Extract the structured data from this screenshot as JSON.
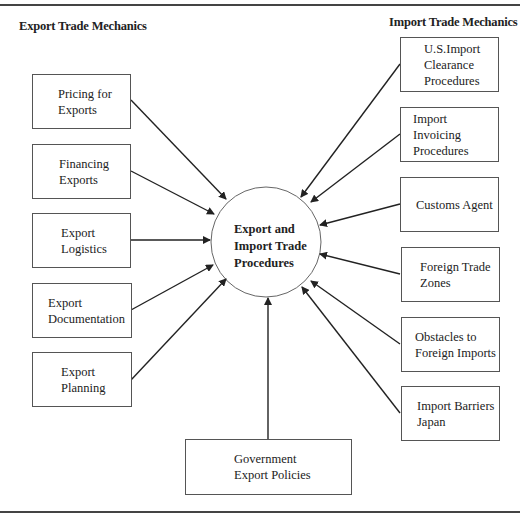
{
  "headings": {
    "export": "Export Trade Mechanics",
    "import": "Import Trade Mechanics"
  },
  "center": {
    "label": "Export and\nImport Trade\nProcedures"
  },
  "export_boxes": [
    {
      "label": "Pricing for\nExports"
    },
    {
      "label": "Financing\nExports"
    },
    {
      "label": "Export\nLogistics"
    },
    {
      "label": "Export\nDocumentation"
    },
    {
      "label": "Export\nPlanning"
    }
  ],
  "import_boxes": [
    {
      "label": "U.S.Import\nClearance\nProcedures"
    },
    {
      "label": "Import Invoicing\nProcedures"
    },
    {
      "label": "Customs Agent"
    },
    {
      "label": "Foreign Trade\nZones"
    },
    {
      "label": "Obstacles to\nForeign Imports"
    },
    {
      "label": "Import Barriers\nJapan"
    }
  ],
  "bottom_box": {
    "label": "Government\nExport Policies"
  }
}
